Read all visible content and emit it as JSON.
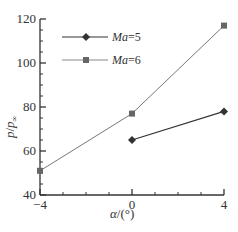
{
  "chart_data": {
    "type": "line",
    "title": "",
    "xlabel": "α/(°)",
    "ylabel": "p/p∞",
    "x": [
      -4,
      0,
      4
    ],
    "xlim": [
      -4,
      4
    ],
    "ylim": [
      40,
      120
    ],
    "xticks": [
      -4,
      0,
      4
    ],
    "yticks": [
      40,
      60,
      80,
      100,
      120
    ],
    "grid": false,
    "legend_position": "upper left",
    "series": [
      {
        "name": "Ma=5",
        "marker": "diamond",
        "color": "#333333",
        "x": [
          0,
          4
        ],
        "values": [
          65,
          78
        ]
      },
      {
        "name": "Ma=6",
        "marker": "square",
        "color": "#777777",
        "x": [
          -4,
          0,
          4
        ],
        "values": [
          51,
          77,
          117
        ]
      }
    ]
  },
  "labels": {
    "x_ticks": [
      "−4",
      "0",
      "4"
    ],
    "y_ticks": [
      "40",
      "60",
      "80",
      "100",
      "120"
    ],
    "xlabel_alpha": "α",
    "xlabel_unit": "/(°)",
    "ylabel_p": "p",
    "ylabel_slash": "/",
    "ylabel_pinf": "p",
    "ylabel_sub": "∞",
    "legend_ma5": "Ma=5",
    "legend_ma6": "Ma=6"
  }
}
